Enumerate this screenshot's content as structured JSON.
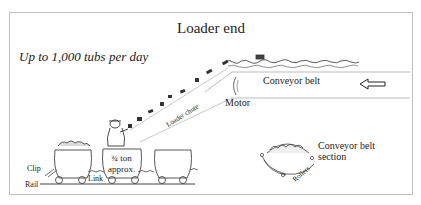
{
  "diagram": {
    "title": "Loader end",
    "subtitle": "Up to 1,000 tubs per day",
    "labels": {
      "conveyor_belt": "Conveyor belt",
      "motor": "Motor",
      "loader_chute": "Loader chute",
      "tub_capacity_line1": "¾ ton",
      "tub_capacity_line2": "approx.",
      "clip": "Clip",
      "rail": "Rail",
      "link": "Link",
      "section_line1": "Conveyor belt",
      "section_line2": "section",
      "rollers": "Rollers"
    },
    "direction_arrow": "left-arrow"
  }
}
